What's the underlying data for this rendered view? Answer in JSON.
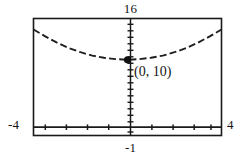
{
  "figure": {
    "kind": "graphing-calculator-viewing-window"
  },
  "window_labels": {
    "ymax": "16",
    "ymin": "-1",
    "xmin": "-4",
    "xmax": "4"
  },
  "annotation": {
    "point_label": "(0, 10)"
  },
  "colors": {
    "frame": "#1a1a1a",
    "curve": "#1f1f1f",
    "axis": "#1a1a1a",
    "text": "#141414",
    "background": "#ffffff",
    "point": "#101010"
  },
  "chart_data": {
    "type": "line",
    "title": "",
    "subtitle": "",
    "xlabel": "",
    "ylabel": "",
    "xlim": [
      -4,
      4
    ],
    "ylim": [
      -1,
      16
    ],
    "grid": false,
    "legend": null,
    "legend_position": "none",
    "x_ticks": [
      -3.5,
      -3,
      -2.5,
      -2,
      -1.5,
      -1,
      -0.5,
      0,
      0.5,
      1,
      1.5,
      2,
      2.5,
      3,
      3.5
    ],
    "x_tick_labels": [],
    "y_ticks": [
      0,
      1,
      2,
      3,
      4,
      5,
      6,
      7,
      8,
      9,
      10,
      11,
      12,
      13,
      14,
      15,
      16
    ],
    "y_tick_labels": [],
    "axis_note": "x-axis drawn at y=0, y-axis drawn at x=0; tick marks shown without numeric labels",
    "series": [
      {
        "name": "parabola",
        "style": "dashed",
        "equation_form": "y = a*x^2 + 10",
        "x": [
          -4,
          -3.5,
          -3,
          -2.5,
          -2,
          -1.5,
          -1,
          -0.5,
          0,
          0.5,
          1,
          1.5,
          2,
          2.5,
          3,
          3.5,
          4
        ],
        "y": [
          14.4,
          13.4,
          12.5,
          11.7,
          11.1,
          10.6,
          10.3,
          10.1,
          10,
          10.1,
          10.3,
          10.6,
          11.1,
          11.7,
          12.5,
          13.4,
          14.4
        ]
      }
    ],
    "annotations": [
      {
        "label": "(0, 10)",
        "x": 0,
        "y": 10,
        "marker": "filled-circle"
      }
    ]
  }
}
